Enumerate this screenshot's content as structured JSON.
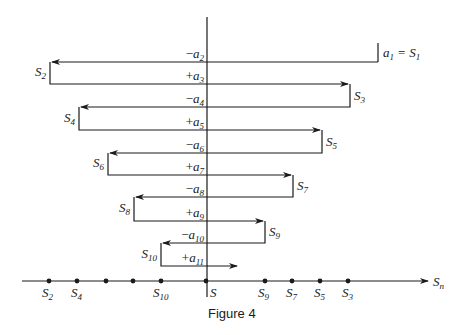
{
  "figure": {
    "caption": "Figure 4",
    "axis_label": "S",
    "axis_label_sub": "n",
    "origin_label": "S",
    "first_term": {
      "lhs": "a",
      "lhs_sub": "1",
      "eq": "=",
      "rhs": "S",
      "rhs_sub": "1"
    },
    "steps": [
      {
        "sign": "−",
        "term": "a",
        "sub": "2"
      },
      {
        "sign": "+",
        "term": "a",
        "sub": "3"
      },
      {
        "sign": "−",
        "term": "a",
        "sub": "4"
      },
      {
        "sign": "+",
        "term": "a",
        "sub": "5"
      },
      {
        "sign": "−",
        "term": "a",
        "sub": "6"
      },
      {
        "sign": "+",
        "term": "a",
        "sub": "7"
      },
      {
        "sign": "−",
        "term": "a",
        "sub": "8"
      },
      {
        "sign": "+",
        "term": "a",
        "sub": "9"
      },
      {
        "sign": "−",
        "term": "a",
        "sub": "10"
      },
      {
        "sign": "+",
        "term": "a",
        "sub": "11"
      }
    ],
    "partial_sum_labels": [
      {
        "name": "S",
        "sub": "2"
      },
      {
        "name": "S",
        "sub": "3"
      },
      {
        "name": "S",
        "sub": "4"
      },
      {
        "name": "S",
        "sub": "5"
      },
      {
        "name": "S",
        "sub": "6"
      },
      {
        "name": "S",
        "sub": "7"
      },
      {
        "name": "S",
        "sub": "8"
      },
      {
        "name": "S",
        "sub": "9"
      },
      {
        "name": "S",
        "sub": "10"
      }
    ],
    "number_line_labels": [
      {
        "name": "S",
        "sub": "2"
      },
      {
        "name": "S",
        "sub": "4"
      },
      {
        "name": "S",
        "sub": "10"
      },
      {
        "name": "S",
        "sub": "9"
      },
      {
        "name": "S",
        "sub": "7"
      },
      {
        "name": "S",
        "sub": "5"
      },
      {
        "name": "S",
        "sub": "3"
      }
    ]
  }
}
